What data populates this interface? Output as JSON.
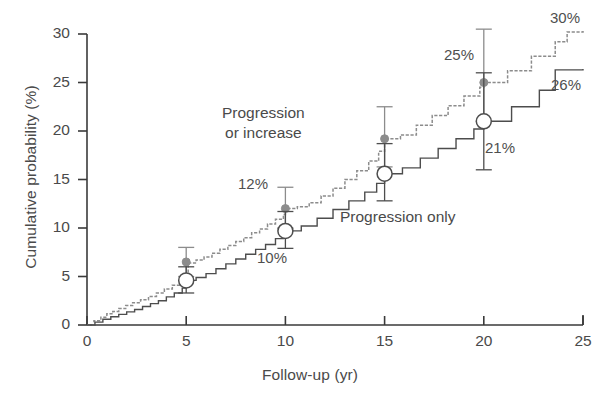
{
  "chart_data": {
    "type": "line",
    "title": "",
    "xlabel": "Follow-up (yr)",
    "ylabel": "Cumulative probability (%)",
    "xlim": [
      0,
      25
    ],
    "ylim": [
      0,
      30
    ],
    "xticks": [
      "0",
      "5",
      "10",
      "15",
      "20",
      "25"
    ],
    "yticks": [
      "0",
      "5",
      "10",
      "15",
      "20",
      "25",
      "30"
    ],
    "grid": false,
    "legend_position": "inline-annotations",
    "series": [
      {
        "name": "Progression or increase",
        "style": "stepped-dotted-gray",
        "color": "#8c8c8c",
        "marker": "filled-circle",
        "end_label": "30%",
        "points": [
          {
            "x": 5,
            "y": 6.5,
            "label": "",
            "err_low": 5.0,
            "err_high": 8.0
          },
          {
            "x": 10,
            "y": 12.0,
            "label": "12%",
            "err_low": 10.0,
            "err_high": 14.2
          },
          {
            "x": 15,
            "y": 19.2,
            "label": "",
            "err_low": 16.3,
            "err_high": 22.5
          },
          {
            "x": 20,
            "y": 25.0,
            "label": "25%",
            "err_low": 21.0,
            "err_high": 30.5
          }
        ],
        "curve": [
          [
            0,
            0
          ],
          [
            0.35,
            0.45
          ],
          [
            0.7,
            0.8
          ],
          [
            1.0,
            1.15
          ],
          [
            1.3,
            1.4
          ],
          [
            1.6,
            1.7
          ],
          [
            1.95,
            2.0
          ],
          [
            2.3,
            2.3
          ],
          [
            2.7,
            2.6
          ],
          [
            3.1,
            2.95
          ],
          [
            3.5,
            3.3
          ],
          [
            3.9,
            3.7
          ],
          [
            4.3,
            4.1
          ],
          [
            4.7,
            4.5
          ],
          [
            5.0,
            4.9
          ],
          [
            5.1,
            6.4
          ],
          [
            5.5,
            6.7
          ],
          [
            5.9,
            7.0
          ],
          [
            6.3,
            7.4
          ],
          [
            6.7,
            7.8
          ],
          [
            7.1,
            8.2
          ],
          [
            7.5,
            8.6
          ],
          [
            7.9,
            9.0
          ],
          [
            8.3,
            9.5
          ],
          [
            8.7,
            9.9
          ],
          [
            9.1,
            10.4
          ],
          [
            9.5,
            10.9
          ],
          [
            9.9,
            11.4
          ],
          [
            10.0,
            12.0
          ],
          [
            10.6,
            12.2
          ],
          [
            11.2,
            12.6
          ],
          [
            11.8,
            13.3
          ],
          [
            12.4,
            14.1
          ],
          [
            13.0,
            15.0
          ],
          [
            13.6,
            15.9
          ],
          [
            14.2,
            16.9
          ],
          [
            14.7,
            17.9
          ],
          [
            15.0,
            19.2
          ],
          [
            15.8,
            19.6
          ],
          [
            16.6,
            20.6
          ],
          [
            17.4,
            21.6
          ],
          [
            18.2,
            22.6
          ],
          [
            19.0,
            23.6
          ],
          [
            19.8,
            24.5
          ],
          [
            20.0,
            25.0
          ],
          [
            21.2,
            26.2
          ],
          [
            22.4,
            27.7
          ],
          [
            23.6,
            29.2
          ],
          [
            24.2,
            30.2
          ],
          [
            25.0,
            30.3
          ]
        ]
      },
      {
        "name": "Progression only",
        "style": "stepped-solid-dark",
        "color": "#4d4d4d",
        "marker": "open-circle",
        "end_label": "26%",
        "points": [
          {
            "x": 5,
            "y": 4.6,
            "label": "",
            "err_low": 3.3,
            "err_high": 6.0
          },
          {
            "x": 10,
            "y": 9.7,
            "label": "10%",
            "err_low": 7.9,
            "err_high": 11.7
          },
          {
            "x": 15,
            "y": 15.6,
            "label": "",
            "err_low": 12.8,
            "err_high": 18.7
          },
          {
            "x": 20,
            "y": 21.0,
            "label": "21%",
            "err_low": 16.0,
            "err_high": 26.0
          }
        ],
        "curve": [
          [
            0,
            0
          ],
          [
            0.4,
            0.3
          ],
          [
            0.8,
            0.6
          ],
          [
            1.2,
            0.85
          ],
          [
            1.6,
            1.1
          ],
          [
            2.0,
            1.35
          ],
          [
            2.4,
            1.6
          ],
          [
            2.8,
            1.9
          ],
          [
            3.2,
            2.2
          ],
          [
            3.6,
            2.5
          ],
          [
            4.0,
            2.9
          ],
          [
            4.4,
            3.3
          ],
          [
            4.8,
            3.8
          ],
          [
            5.0,
            4.6
          ],
          [
            5.5,
            4.9
          ],
          [
            6.0,
            5.3
          ],
          [
            6.5,
            5.8
          ],
          [
            7.0,
            6.3
          ],
          [
            7.5,
            6.8
          ],
          [
            8.0,
            7.3
          ],
          [
            8.5,
            7.8
          ],
          [
            9.0,
            8.3
          ],
          [
            9.5,
            8.9
          ],
          [
            9.9,
            9.4
          ],
          [
            10.0,
            9.7
          ],
          [
            10.8,
            10.2
          ],
          [
            11.6,
            11.0
          ],
          [
            12.4,
            11.9
          ],
          [
            13.2,
            12.8
          ],
          [
            14.0,
            13.7
          ],
          [
            14.6,
            14.6
          ],
          [
            15.0,
            15.6
          ],
          [
            15.9,
            16.2
          ],
          [
            16.8,
            17.2
          ],
          [
            17.7,
            18.2
          ],
          [
            18.6,
            19.2
          ],
          [
            19.5,
            20.2
          ],
          [
            20.0,
            21.0
          ],
          [
            21.4,
            22.5
          ],
          [
            22.8,
            24.2
          ],
          [
            23.6,
            26.3
          ],
          [
            25.0,
            26.4
          ]
        ]
      }
    ],
    "annotations": [
      {
        "text": "Progression\nor increase",
        "x_px": 222,
        "y_px": 103,
        "kind": "series-note"
      },
      {
        "text": "Progression only",
        "x_px": 340,
        "y_px": 207,
        "kind": "series-note"
      },
      {
        "text": "12%",
        "x_px": 238,
        "y_px": 174,
        "kind": "value-label"
      },
      {
        "text": "10%",
        "x_px": 257,
        "y_px": 248,
        "kind": "value-label"
      },
      {
        "text": "25%",
        "x_px": 444,
        "y_px": 45,
        "kind": "value-label"
      },
      {
        "text": "21%",
        "x_px": 485,
        "y_px": 138,
        "kind": "value-label"
      },
      {
        "text": "30%",
        "x_px": 550,
        "y_px": 8,
        "kind": "value-label"
      },
      {
        "text": "26%",
        "x_px": 551,
        "y_px": 75,
        "kind": "value-label"
      }
    ]
  },
  "axes": {
    "x_title": "Follow-up (yr)",
    "y_title": "Cumulative probability (%)",
    "x_tick_labels": [
      "0",
      "5",
      "10",
      "15",
      "20",
      "25"
    ],
    "y_tick_labels": [
      "0",
      "5",
      "10",
      "15",
      "20",
      "25",
      "30"
    ]
  },
  "colors": {
    "series_progression_or_increase": "#8c8c8c",
    "series_progression_only": "#4d4d4d",
    "axis": "#3a3a3a",
    "text": "#4a4a4a",
    "background": "#ffffff"
  }
}
